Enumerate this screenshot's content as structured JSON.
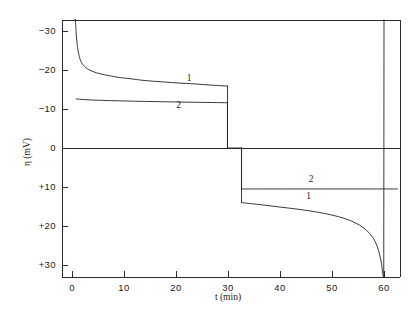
{
  "chart_data": {
    "type": "line",
    "title": "",
    "xlabel": "t (min)",
    "ylabel": "η (mV)",
    "xlim": [
      -2,
      63
    ],
    "ylim_display_top": -35,
    "ylim_display_bottom": 35,
    "y_axis_inverted": true,
    "grid": false,
    "legend": "inline-curve-labels",
    "xticks": [
      0,
      10,
      20,
      30,
      40,
      50,
      60
    ],
    "xtick_labels": [
      "0",
      "10",
      "20",
      "30",
      "40",
      "50",
      "60"
    ],
    "yticks": [
      -30,
      -20,
      -10,
      0,
      10,
      20,
      30
    ],
    "ytick_labels": [
      "−30",
      "−20",
      "−10",
      "0",
      "+10",
      "+20",
      "+30"
    ],
    "zero_line": true,
    "annotations": [
      {
        "text": "1",
        "x": 22.5,
        "y": -17.2,
        "name": "curve-1-label-cathodic"
      },
      {
        "text": "2",
        "x": 20.5,
        "y": -10.2,
        "name": "curve-2-label-cathodic"
      },
      {
        "text": "2",
        "x": 46.0,
        "y": 8.6,
        "name": "curve-2-label-anodic"
      },
      {
        "text": "1",
        "x": 45.5,
        "y": 13.0,
        "name": "curve-1-label-anodic"
      }
    ],
    "series": [
      {
        "name": "1",
        "label": "1",
        "color": "#222222",
        "segments": [
          {
            "name": "curve-1-cathodic",
            "points": [
              [
                0.55,
                -36.0
              ],
              [
                0.65,
                -33.0
              ],
              [
                0.8,
                -29.5
              ],
              [
                1.0,
                -26.5
              ],
              [
                1.3,
                -24.0
              ],
              [
                1.7,
                -22.3
              ],
              [
                2.2,
                -21.2
              ],
              [
                3.0,
                -20.3
              ],
              [
                4.0,
                -19.6
              ],
              [
                5.5,
                -19.0
              ],
              [
                7.0,
                -18.6
              ],
              [
                9.0,
                -18.1
              ],
              [
                11.0,
                -17.8
              ],
              [
                14.0,
                -17.3
              ],
              [
                17.0,
                -17.0
              ],
              [
                20.0,
                -16.7
              ],
              [
                24.0,
                -16.4
              ],
              [
                27.0,
                -16.1
              ],
              [
                29.9,
                -15.9
              ]
            ]
          },
          {
            "name": "curve-1-cathodic-to-zero",
            "points": [
              [
                29.9,
                -15.9
              ],
              [
                29.9,
                0.0
              ]
            ]
          },
          {
            "name": "curve-1-zero-plateau",
            "points": [
              [
                29.9,
                0.0
              ],
              [
                32.6,
                0.0
              ]
            ]
          },
          {
            "name": "curve-1-zero-to-anodic",
            "points": [
              [
                32.6,
                0.0
              ],
              [
                32.6,
                14.0
              ]
            ]
          },
          {
            "name": "curve-1-anodic",
            "points": [
              [
                32.6,
                14.0
              ],
              [
                34.0,
                14.2
              ],
              [
                36.0,
                14.5
              ],
              [
                38.5,
                14.9
              ],
              [
                41.0,
                15.3
              ],
              [
                44.0,
                15.8
              ],
              [
                47.0,
                16.4
              ],
              [
                50.0,
                17.2
              ],
              [
                52.5,
                18.1
              ],
              [
                54.5,
                19.2
              ],
              [
                56.0,
                20.4
              ],
              [
                57.3,
                22.0
              ],
              [
                58.3,
                24.0
              ],
              [
                59.0,
                26.5
              ],
              [
                59.5,
                29.5
              ],
              [
                59.8,
                32.5
              ],
              [
                59.95,
                35.0
              ]
            ]
          },
          {
            "name": "curve-1-anodic-return",
            "points": [
              [
                59.95,
                35.0
              ],
              [
                60.0,
                -34.0
              ]
            ]
          }
        ]
      },
      {
        "name": "2",
        "label": "2",
        "color": "#222222",
        "segments": [
          {
            "name": "curve-2-cathodic",
            "points": [
              [
                0.8,
                -12.6
              ],
              [
                1.5,
                -12.5
              ],
              [
                2.5,
                -12.4
              ],
              [
                4.0,
                -12.3
              ],
              [
                6.0,
                -12.2
              ],
              [
                9.0,
                -12.1
              ],
              [
                12.0,
                -12.0
              ],
              [
                16.0,
                -11.9
              ],
              [
                20.0,
                -11.8
              ],
              [
                25.0,
                -11.7
              ],
              [
                29.9,
                -11.6
              ]
            ]
          },
          {
            "name": "curve-2-cathodic-to-zero",
            "points": [
              [
                29.9,
                -11.6
              ],
              [
                29.9,
                0.0
              ]
            ]
          },
          {
            "name": "curve-2-zero-to-anodic",
            "points": [
              [
                32.6,
                0.0
              ],
              [
                32.6,
                10.5
              ]
            ]
          },
          {
            "name": "curve-2-anodic",
            "points": [
              [
                32.6,
                10.5
              ],
              [
                36.0,
                10.5
              ],
              [
                42.0,
                10.5
              ],
              [
                48.0,
                10.5
              ],
              [
                54.0,
                10.5
              ],
              [
                60.0,
                10.5
              ],
              [
                62.6,
                10.5
              ]
            ]
          }
        ]
      }
    ]
  }
}
